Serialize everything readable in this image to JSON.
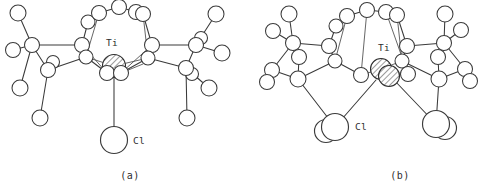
{
  "figure": {
    "background_color": "#ffffff",
    "line_color": "#3a3a3a",
    "panels": [
      {
        "caption": "(a)",
        "id": "panel-a",
        "description": "Monomeric titanium calixarene complex with one terminal chloride"
      },
      {
        "caption": "(b)",
        "id": "panel-b",
        "description": "Dimeric titanium calixarene complex with two chlorides"
      }
    ]
  },
  "labels": {
    "titanium": "Ti",
    "chlorine": "Cl"
  },
  "panel_a": {
    "caption": "(a)",
    "metal_label": "Ti",
    "metal_label_x": 106,
    "metal_label_y": 46,
    "chloride_label": "Cl",
    "chloride_label_x": 133,
    "chloride_label_y": 138,
    "metals": [
      {
        "cx": 114,
        "cy": 66,
        "r": 11.5,
        "hatched": true
      }
    ],
    "big_atoms": [
      {
        "cx": 114,
        "cy": 140,
        "r": 13.5
      }
    ],
    "atoms": [
      {
        "cx": 99,
        "cy": 13,
        "r": 7.5
      },
      {
        "cx": 119,
        "cy": 7,
        "r": 7.5
      },
      {
        "cx": 136,
        "cy": 12,
        "r": 7.5
      },
      {
        "cx": 143,
        "cy": 14,
        "r": 7.5
      },
      {
        "cx": 88,
        "cy": 22,
        "r": 7.0
      },
      {
        "cx": 82,
        "cy": 45,
        "r": 7.5
      },
      {
        "cx": 86,
        "cy": 57,
        "r": 7.0
      },
      {
        "cx": 152,
        "cy": 45,
        "r": 7.5
      },
      {
        "cx": 148,
        "cy": 58,
        "r": 7.0
      },
      {
        "cx": 107,
        "cy": 73,
        "r": 7.5
      },
      {
        "cx": 121,
        "cy": 73,
        "r": 7.5
      },
      {
        "cx": 32,
        "cy": 45,
        "r": 7.5
      },
      {
        "cx": 13,
        "cy": 50,
        "r": 7.5
      },
      {
        "cx": 18,
        "cy": 13,
        "r": 8.0
      },
      {
        "cx": 20,
        "cy": 88,
        "r": 8.0
      },
      {
        "cx": 40,
        "cy": 118,
        "r": 8.0
      },
      {
        "cx": 48,
        "cy": 70,
        "r": 7.5
      },
      {
        "cx": 53,
        "cy": 62,
        "r": 6.5
      },
      {
        "cx": 196,
        "cy": 45,
        "r": 7.5
      },
      {
        "cx": 201,
        "cy": 38,
        "r": 6.5
      },
      {
        "cx": 216,
        "cy": 14,
        "r": 8.0
      },
      {
        "cx": 222,
        "cy": 53,
        "r": 8.0
      },
      {
        "cx": 186,
        "cy": 68,
        "r": 7.5
      },
      {
        "cx": 192,
        "cy": 74,
        "r": 6.5
      },
      {
        "cx": 209,
        "cy": 88,
        "r": 8.0
      },
      {
        "cx": 187,
        "cy": 118,
        "r": 8.0
      }
    ]
  },
  "panel_b": {
    "caption": "(b)",
    "metal_label": "Ti",
    "metal_label_x": 130,
    "metal_label_y": 51,
    "chloride_label": "Cl",
    "chloride_label_x": 100,
    "chloride_label_y": 125,
    "metals": [
      {
        "cx": 133,
        "cy": 69,
        "r": 10.5,
        "hatched": true
      },
      {
        "cx": 141,
        "cy": 76,
        "r": 10.5,
        "hatched": true
      }
    ],
    "big_atoms": [
      {
        "cx": 87,
        "cy": 127,
        "r": 13.5
      },
      {
        "cx": 188,
        "cy": 124,
        "r": 13.5
      },
      {
        "cx": 78,
        "cy": 131,
        "r": 11.5
      },
      {
        "cx": 197,
        "cy": 128,
        "r": 11.5
      }
    ],
    "atoms": [
      {
        "cx": 99,
        "cy": 16,
        "r": 7.5
      },
      {
        "cx": 119,
        "cy": 10,
        "r": 7.5
      },
      {
        "cx": 138,
        "cy": 12,
        "r": 7.5
      },
      {
        "cx": 149,
        "cy": 15,
        "r": 7.5
      },
      {
        "cx": 88,
        "cy": 26,
        "r": 7.0
      },
      {
        "cx": 81,
        "cy": 46,
        "r": 7.5
      },
      {
        "cx": 87,
        "cy": 61,
        "r": 7.0
      },
      {
        "cx": 159,
        "cy": 46,
        "r": 7.5
      },
      {
        "cx": 154,
        "cy": 61,
        "r": 7.0
      },
      {
        "cx": 113,
        "cy": 75,
        "r": 7.5
      },
      {
        "cx": 160,
        "cy": 74,
        "r": 7.5
      },
      {
        "cx": 45,
        "cy": 43,
        "r": 7.5
      },
      {
        "cx": 25,
        "cy": 31,
        "r": 7.5
      },
      {
        "cx": 41,
        "cy": 14,
        "r": 8.0
      },
      {
        "cx": 24,
        "cy": 70,
        "r": 7.5
      },
      {
        "cx": 19,
        "cy": 82,
        "r": 7.5
      },
      {
        "cx": 50,
        "cy": 79,
        "r": 8.0
      },
      {
        "cx": 51,
        "cy": 57,
        "r": 7.5
      },
      {
        "cx": 196,
        "cy": 43,
        "r": 7.5
      },
      {
        "cx": 213,
        "cy": 30,
        "r": 7.5
      },
      {
        "cx": 197,
        "cy": 14,
        "r": 8.0
      },
      {
        "cx": 217,
        "cy": 69,
        "r": 7.5
      },
      {
        "cx": 222,
        "cy": 81,
        "r": 7.5
      },
      {
        "cx": 191,
        "cy": 79,
        "r": 8.0
      },
      {
        "cx": 190,
        "cy": 57,
        "r": 7.5
      }
    ]
  }
}
